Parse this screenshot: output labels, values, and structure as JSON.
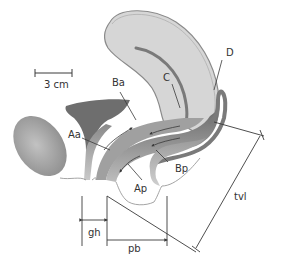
{
  "diagram": {
    "type": "anatomical-sagittal-section",
    "scale_bar": {
      "label": "3 cm"
    },
    "labels": {
      "Aa": "Aa",
      "Ap": "Ap",
      "Ba": "Ba",
      "Bp": "Bp",
      "C": "C",
      "D": "D",
      "gh": "gh",
      "pb": "pb",
      "tvl": "tvl"
    },
    "colors": {
      "uterus_fill": "#d6d6d6",
      "uterus_stroke": "#8a8a8a",
      "dark_tissue": "#6e6e6e",
      "mid_tissue": "#a8a8a8",
      "light_tissue": "#c4c4c4",
      "line": "#3a3a3a",
      "outline": "#9a9a9a"
    }
  }
}
